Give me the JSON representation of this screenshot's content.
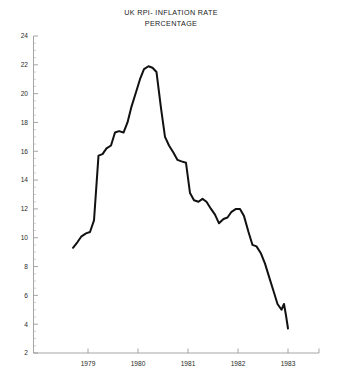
{
  "title": {
    "line1": "UK RPI- INFLATION RATE",
    "line2": "PERCENTAGE"
  },
  "chart_data": {
    "type": "line",
    "title": "UK RPI- INFLATION RATE PERCENTAGE",
    "subtitle": "PERCENTAGE",
    "xlabel": "",
    "ylabel": "",
    "xlim": [
      1978.67,
      1983.25
    ],
    "ylim": [
      2,
      24
    ],
    "ytick_step": 2,
    "grid": false,
    "legend": null,
    "line_color": "#111111",
    "axis_color": "#8f8f8f",
    "background": "#ffffff",
    "ytick_labels": [
      "2",
      "4",
      "6",
      "8",
      "10",
      "12",
      "14",
      "16",
      "18",
      "20",
      "22",
      "24"
    ],
    "ytick_values": [
      2,
      4,
      6,
      8,
      10,
      12,
      14,
      16,
      18,
      20,
      22,
      24
    ],
    "xtick_labels": [
      "1979",
      "1980",
      "1981",
      "1982",
      "1983"
    ],
    "xtick_values": [
      1979,
      1980,
      1981,
      1982,
      1983
    ],
    "series": [
      {
        "name": "UK RPI Inflation Rate",
        "x": [
          1978.7,
          1978.79,
          1978.87,
          1978.96,
          1979.04,
          1979.12,
          1979.21,
          1979.29,
          1979.37,
          1979.46,
          1979.54,
          1979.62,
          1979.71,
          1979.79,
          1979.87,
          1979.96,
          1980.04,
          1980.12,
          1980.21,
          1980.29,
          1980.37,
          1980.46,
          1980.54,
          1980.62,
          1980.71,
          1980.79,
          1980.87,
          1980.96,
          1981.04,
          1981.12,
          1981.21,
          1981.29,
          1981.37,
          1981.46,
          1981.54,
          1981.62,
          1981.71,
          1981.79,
          1981.87,
          1981.96,
          1982.04,
          1982.12,
          1982.21,
          1982.29,
          1982.37,
          1982.46,
          1982.54,
          1982.62,
          1982.71,
          1982.79,
          1982.87
        ],
        "y": [
          9.3,
          9.7,
          10.1,
          10.3,
          10.4,
          11.2,
          15.7,
          15.8,
          16.2,
          16.4,
          17.3,
          17.4,
          17.3,
          18.0,
          19.1,
          20.1,
          21.0,
          21.7,
          21.9,
          21.8,
          21.5,
          19.0,
          17.0,
          16.4,
          15.9,
          15.4,
          15.3,
          15.2,
          13.1,
          12.6,
          12.5,
          12.7,
          12.5,
          12.0,
          11.6,
          11.0,
          11.3,
          11.4,
          11.8,
          12.0,
          12.0,
          11.5,
          10.4,
          9.5,
          9.4,
          8.9,
          8.2,
          7.3,
          6.3,
          5.4,
          5.0
        ]
      }
    ],
    "series_extra_tail": {
      "x": [
        1982.87,
        1982.92,
        1982.96,
        1983.0
      ],
      "y": [
        5.0,
        5.4,
        4.6,
        3.7
      ]
    },
    "annotations": [],
    "peak": {
      "x": 1980.21,
      "y": 21.9
    },
    "start": {
      "x": 1978.7,
      "y": 9.3
    },
    "end": {
      "x": 1983.0,
      "y": 3.7
    }
  }
}
